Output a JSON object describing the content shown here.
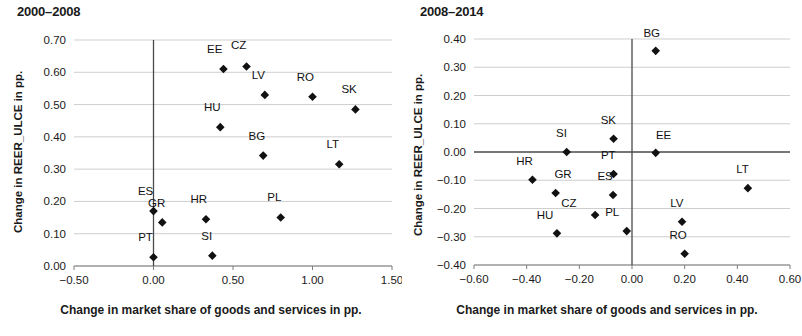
{
  "charts": [
    {
      "title": "2000–2008",
      "xlabel": "Change in market share of goods and services in pp.",
      "ylabel": "Change in REER_ULCE in pp."
    },
    {
      "title": "2008–2014",
      "xlabel": "Change in market share of goods and services in pp.",
      "ylabel": "Change in REER_ULCE in pp."
    }
  ],
  "chart_data": [
    {
      "type": "scatter",
      "title": "2000–2008",
      "xlabel": "Change in market share of goods and services in pp.",
      "ylabel": "Change in REER_ULCE in pp.",
      "xlim": [
        -0.5,
        1.5
      ],
      "ylim": [
        0.0,
        0.7
      ],
      "xticks": [
        -0.5,
        0.0,
        0.5,
        1.0,
        1.5
      ],
      "xticklabels": [
        "−0.50",
        "0.00",
        "0.50",
        "1.00",
        "1.50"
      ],
      "yticks": [
        0.0,
        0.1,
        0.2,
        0.3,
        0.4,
        0.5,
        0.6,
        0.7
      ],
      "yticklabels": [
        "0.00",
        "0.10",
        "0.20",
        "0.30",
        "0.40",
        "0.50",
        "0.60",
        "0.70"
      ],
      "grid": "horizontal",
      "legend": "none",
      "marker": "diamond",
      "marker_color": "#111111",
      "points": [
        {
          "label": "EE",
          "x": 0.44,
          "y": 0.61,
          "lx": -0.055,
          "ly": 0.05
        },
        {
          "label": "CZ",
          "x": 0.585,
          "y": 0.618,
          "lx": -0.05,
          "ly": 0.055
        },
        {
          "label": "LV",
          "x": 0.7,
          "y": 0.53,
          "lx": -0.04,
          "ly": 0.048
        },
        {
          "label": "RO",
          "x": 1.0,
          "y": 0.524,
          "lx": -0.045,
          "ly": 0.05
        },
        {
          "label": "SK",
          "x": 1.27,
          "y": 0.485,
          "lx": -0.04,
          "ly": 0.05
        },
        {
          "label": "HU",
          "x": 0.42,
          "y": 0.43,
          "lx": -0.05,
          "ly": 0.05
        },
        {
          "label": "BG",
          "x": 0.69,
          "y": 0.342,
          "lx": -0.04,
          "ly": 0.048
        },
        {
          "label": "LT",
          "x": 1.168,
          "y": 0.315,
          "lx": -0.04,
          "ly": 0.05
        },
        {
          "label": "ES",
          "x": 0.0,
          "y": 0.17,
          "lx": -0.05,
          "ly": 0.05
        },
        {
          "label": "GR",
          "x": 0.055,
          "y": 0.135,
          "lx": -0.035,
          "ly": 0.048
        },
        {
          "label": "HR",
          "x": 0.33,
          "y": 0.145,
          "lx": -0.045,
          "ly": 0.05
        },
        {
          "label": "PL",
          "x": 0.8,
          "y": 0.15,
          "lx": -0.04,
          "ly": 0.05
        },
        {
          "label": "PT",
          "x": 0.0,
          "y": 0.027,
          "lx": -0.05,
          "ly": 0.05
        },
        {
          "label": "SI",
          "x": 0.37,
          "y": 0.032,
          "lx": -0.035,
          "ly": 0.05
        }
      ]
    },
    {
      "type": "scatter",
      "title": "2008–2014",
      "xlabel": "Change in market share of goods and services in pp.",
      "ylabel": "Change in REER_ULCE in pp.",
      "xlim": [
        -0.6,
        0.6
      ],
      "ylim": [
        -0.4,
        0.4
      ],
      "xticks": [
        -0.6,
        -0.4,
        -0.2,
        0.0,
        0.2,
        0.4,
        0.6
      ],
      "xticklabels": [
        "−0.60",
        "−0.40",
        "−0.20",
        "0.00",
        "0.20",
        "0.40",
        "0.60"
      ],
      "yticks": [
        -0.4,
        -0.3,
        -0.2,
        -0.1,
        0.0,
        0.1,
        0.2,
        0.3,
        0.4
      ],
      "yticklabels": [
        "−0.40",
        "−0.30",
        "−0.20",
        "−0.10",
        "0.00",
        "0.10",
        "0.20",
        "0.30",
        "0.40"
      ],
      "grid": "horizontal",
      "legend": "none",
      "marker": "diamond",
      "marker_color": "#111111",
      "points": [
        {
          "label": "BG",
          "x": 0.09,
          "y": 0.358,
          "lx": -0.015,
          "ly": 0.05
        },
        {
          "label": "SK",
          "x": -0.07,
          "y": 0.047,
          "lx": -0.02,
          "ly": 0.052
        },
        {
          "label": "SI",
          "x": -0.248,
          "y": 0.0,
          "lx": -0.02,
          "ly": 0.052
        },
        {
          "label": "EE",
          "x": 0.09,
          "y": -0.003,
          "lx": 0.03,
          "ly": 0.05
        },
        {
          "label": "PT",
          "x": -0.07,
          "y": -0.078,
          "lx": -0.02,
          "ly": 0.052
        },
        {
          "label": "HR",
          "x": -0.378,
          "y": -0.098,
          "lx": -0.03,
          "ly": 0.052
        },
        {
          "label": "LT",
          "x": 0.44,
          "y": -0.128,
          "lx": -0.02,
          "ly": 0.052
        },
        {
          "label": "GR",
          "x": -0.29,
          "y": -0.145,
          "lx": 0.028,
          "ly": 0.052
        },
        {
          "label": "ES",
          "x": -0.072,
          "y": -0.152,
          "lx": -0.03,
          "ly": 0.052
        },
        {
          "label": "CZ",
          "x": -0.14,
          "y": -0.223,
          "lx": -0.1,
          "ly": 0.03
        },
        {
          "label": "LV",
          "x": 0.19,
          "y": -0.247,
          "lx": -0.02,
          "ly": 0.052
        },
        {
          "label": "PL",
          "x": -0.02,
          "y": -0.28,
          "lx": -0.055,
          "ly": 0.052
        },
        {
          "label": "HU",
          "x": -0.285,
          "y": -0.288,
          "lx": -0.045,
          "ly": 0.052
        },
        {
          "label": "RO",
          "x": 0.2,
          "y": -0.36,
          "lx": -0.025,
          "ly": 0.052
        }
      ]
    }
  ]
}
